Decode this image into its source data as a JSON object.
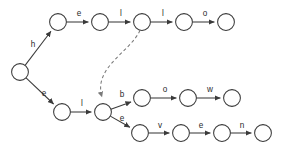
{
  "diagram": {
    "kind": "trie-automaton",
    "canvas": {
      "width": 285,
      "height": 152,
      "background": "#ffffff"
    },
    "style": {
      "node_radius": 8.4,
      "node_fill": "#ffffff",
      "node_stroke": "#3a3a3a",
      "edge_stroke": "#3a3a3a",
      "dashed_edge_stroke": "#7a7a7a",
      "label_color": "#2b2b2b"
    },
    "nodes": [
      {
        "id": "root",
        "label": "",
        "cx": 20,
        "cy": 72
      },
      {
        "id": "t1",
        "label": "",
        "cx": 58,
        "cy": 22
      },
      {
        "id": "t2",
        "label": "",
        "cx": 100,
        "cy": 22
      },
      {
        "id": "t3",
        "label": "",
        "cx": 142,
        "cy": 22
      },
      {
        "id": "t4",
        "label": "",
        "cx": 184,
        "cy": 22
      },
      {
        "id": "t5",
        "label": "",
        "cx": 226,
        "cy": 22
      },
      {
        "id": "b1",
        "label": "",
        "cx": 62,
        "cy": 112
      },
      {
        "id": "hub",
        "label": "",
        "cx": 103,
        "cy": 112
      },
      {
        "id": "m1",
        "label": "",
        "cx": 142,
        "cy": 98
      },
      {
        "id": "m2",
        "label": "",
        "cx": 188,
        "cy": 98
      },
      {
        "id": "m3",
        "label": "",
        "cx": 232,
        "cy": 98
      },
      {
        "id": "n1",
        "label": "",
        "cx": 140,
        "cy": 133
      },
      {
        "id": "n2",
        "label": "",
        "cx": 181,
        "cy": 133
      },
      {
        "id": "n3",
        "label": "",
        "cx": 222,
        "cy": 133
      },
      {
        "id": "n4",
        "label": "",
        "cx": 263,
        "cy": 133
      }
    ],
    "edges": [
      {
        "from": "root",
        "to": "t1",
        "label": "h",
        "label_x": 33,
        "label_y": 47,
        "style": "solid"
      },
      {
        "from": "t1",
        "to": "t2",
        "label": "e",
        "label_x": 79,
        "label_y": 16,
        "style": "solid"
      },
      {
        "from": "t2",
        "to": "t3",
        "label": "l",
        "label_x": 121,
        "label_y": 16,
        "style": "solid"
      },
      {
        "from": "t3",
        "to": "t4",
        "label": "l",
        "label_x": 163,
        "label_y": 16,
        "style": "solid"
      },
      {
        "from": "t4",
        "to": "t5",
        "label": "o",
        "label_x": 205,
        "label_y": 16,
        "style": "solid"
      },
      {
        "from": "root",
        "to": "b1",
        "label": "e",
        "label_x": 44,
        "label_y": 96,
        "style": "solid"
      },
      {
        "from": "b1",
        "to": "hub",
        "label": "l",
        "label_x": 82,
        "label_y": 106,
        "style": "solid"
      },
      {
        "from": "t3",
        "to": "hub",
        "label": "",
        "label_x": 0,
        "label_y": 0,
        "style": "dashed"
      },
      {
        "from": "hub",
        "to": "m1",
        "label": "b",
        "label_x": 122,
        "label_y": 97,
        "style": "solid"
      },
      {
        "from": "m1",
        "to": "m2",
        "label": "o",
        "label_x": 165,
        "label_y": 92,
        "style": "solid"
      },
      {
        "from": "m2",
        "to": "m3",
        "label": "w",
        "label_x": 210,
        "label_y": 92,
        "style": "solid"
      },
      {
        "from": "hub",
        "to": "n1",
        "label": "e",
        "label_x": 122,
        "label_y": 121,
        "style": "solid"
      },
      {
        "from": "n1",
        "to": "n2",
        "label": "v",
        "label_x": 160,
        "label_y": 128,
        "style": "solid"
      },
      {
        "from": "n2",
        "to": "n3",
        "label": "e",
        "label_x": 201,
        "label_y": 128,
        "style": "solid"
      },
      {
        "from": "n3",
        "to": "n4",
        "label": "n",
        "label_x": 242,
        "label_y": 128,
        "style": "solid"
      }
    ],
    "words": [
      "hello",
      "elbow",
      "eleven"
    ],
    "alphabet_labels": [
      "h",
      "e",
      "l",
      "l",
      "o",
      "e",
      "l",
      "b",
      "o",
      "w",
      "e",
      "v",
      "e",
      "n"
    ]
  }
}
